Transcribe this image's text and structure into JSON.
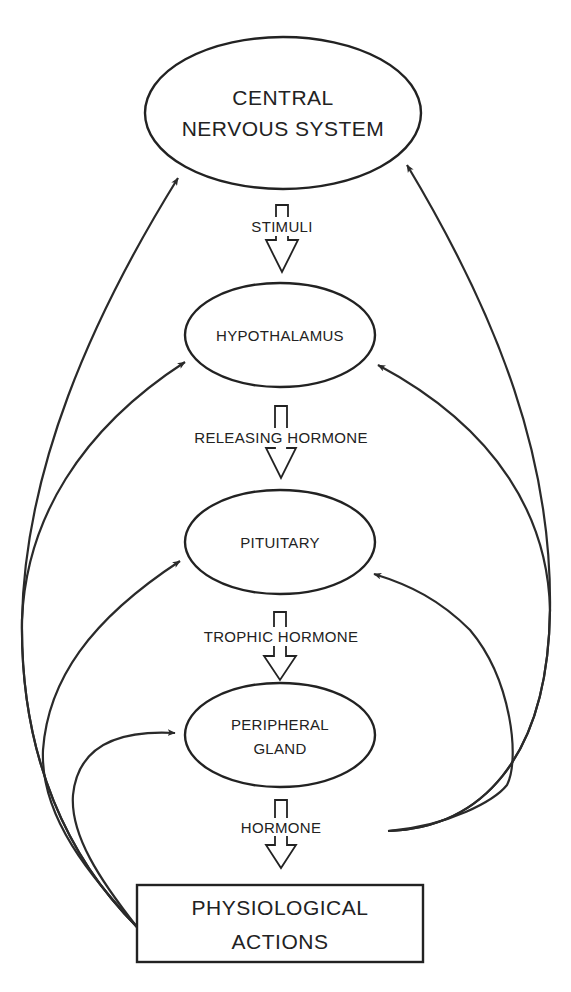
{
  "diagram": {
    "nodes": {
      "cns": {
        "line1": "CENTRAL",
        "line2": "NERVOUS SYSTEM",
        "shape": "ellipse"
      },
      "hypothalamus": {
        "label": "HYPOTHALAMUS",
        "shape": "ellipse"
      },
      "pituitary": {
        "label": "PITUITARY",
        "shape": "ellipse"
      },
      "peripheral_gland": {
        "line1": "PERIPHERAL",
        "line2": "GLAND",
        "shape": "ellipse"
      },
      "physiological_actions": {
        "line1": "PHYSIOLOGICAL",
        "line2": "ACTIONS",
        "shape": "rectangle"
      }
    },
    "flow_arrows": [
      {
        "from": "cns",
        "to": "hypothalamus",
        "label": "STIMULI"
      },
      {
        "from": "hypothalamus",
        "to": "pituitary",
        "label": "RELEASING HORMONE"
      },
      {
        "from": "pituitary",
        "to": "peripheral_gland",
        "label": "TROPHIC HORMONE"
      },
      {
        "from": "peripheral_gland",
        "to": "physiological_actions",
        "label": "HORMONE"
      }
    ],
    "feedback_arrows": {
      "left_from": "physiological_actions",
      "left_targets": [
        "cns",
        "hypothalamus",
        "pituitary",
        "peripheral_gland"
      ],
      "right_from": "hormone",
      "right_targets": [
        "cns",
        "hypothalamus",
        "pituitary"
      ]
    },
    "colors": {
      "line": "#222222",
      "background": "#ffffff"
    }
  }
}
